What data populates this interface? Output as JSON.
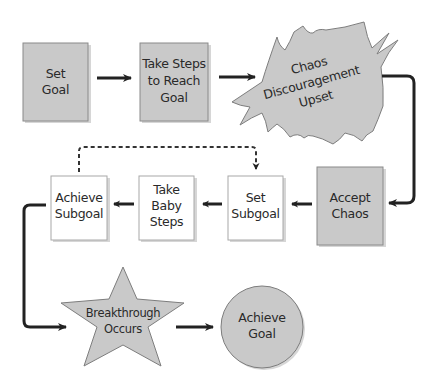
{
  "diagram": {
    "type": "flowchart",
    "nodes": {
      "set_goal": {
        "lines": [
          "Set",
          "Goal"
        ],
        "shape": "rectangle",
        "fill": "#c9c9c9"
      },
      "take_steps": {
        "lines": [
          "Take Steps",
          "to Reach",
          "Goal"
        ],
        "shape": "rectangle",
        "fill": "#c9c9c9"
      },
      "chaos": {
        "lines": [
          "Chaos",
          "Discouragement",
          "Upset"
        ],
        "shape": "burst",
        "fill": "#c9c9c9"
      },
      "accept_chaos": {
        "lines": [
          "Accept",
          "Chaos"
        ],
        "shape": "rectangle",
        "fill": "#c9c9c9"
      },
      "set_subgoal": {
        "lines": [
          "Set",
          "Subgoal"
        ],
        "shape": "rectangle",
        "fill": "#ffffff"
      },
      "take_baby_steps": {
        "lines": [
          "Take",
          "Baby",
          "Steps"
        ],
        "shape": "rectangle",
        "fill": "#ffffff"
      },
      "achieve_subgoal": {
        "lines": [
          "Achieve",
          "Subgoal"
        ],
        "shape": "rectangle",
        "fill": "#ffffff"
      },
      "breakthrough": {
        "lines": [
          "Breakthrough",
          "Occurs"
        ],
        "shape": "star",
        "fill": "#c9c9c9"
      },
      "achieve_goal": {
        "lines": [
          "Achieve",
          "Goal"
        ],
        "shape": "circle",
        "fill": "#c9c9c9"
      }
    },
    "edges": [
      {
        "from": "set_goal",
        "to": "take_steps",
        "style": "solid"
      },
      {
        "from": "take_steps",
        "to": "chaos",
        "style": "solid"
      },
      {
        "from": "chaos",
        "to": "accept_chaos",
        "style": "solid"
      },
      {
        "from": "accept_chaos",
        "to": "set_subgoal",
        "style": "solid"
      },
      {
        "from": "set_subgoal",
        "to": "take_baby_steps",
        "style": "solid"
      },
      {
        "from": "take_baby_steps",
        "to": "achieve_subgoal",
        "style": "solid"
      },
      {
        "from": "achieve_subgoal",
        "to": "set_subgoal",
        "style": "dotted"
      },
      {
        "from": "achieve_subgoal",
        "to": "breakthrough",
        "style": "solid"
      },
      {
        "from": "breakthrough",
        "to": "achieve_goal",
        "style": "solid"
      }
    ]
  },
  "colors": {
    "shaded_fill": "#c9c9c9",
    "plain_fill": "#ffffff",
    "line": "#222222"
  }
}
